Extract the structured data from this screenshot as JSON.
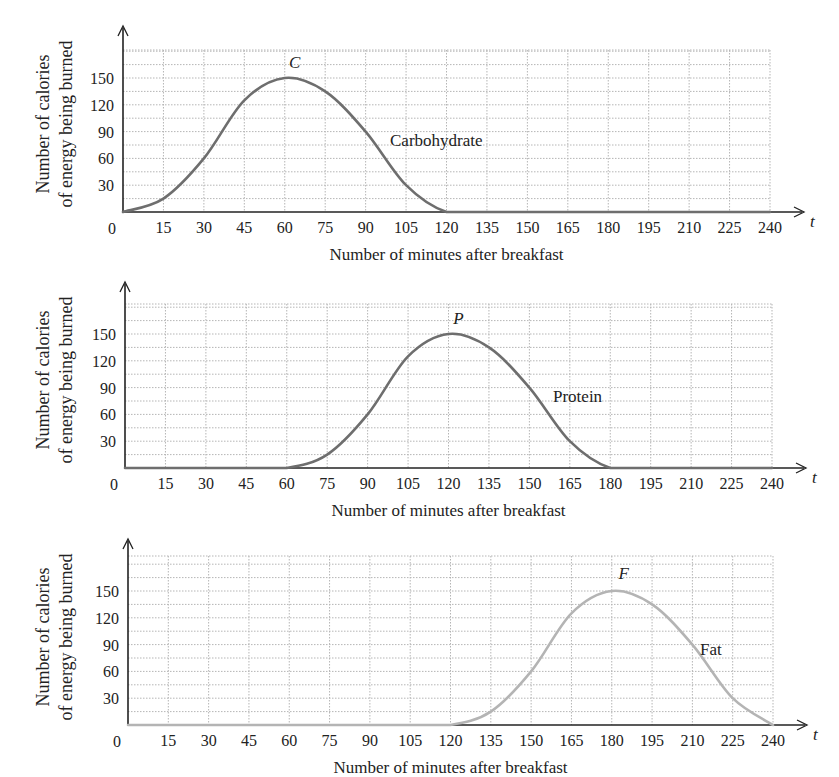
{
  "chart_data": [
    {
      "type": "line",
      "title": "",
      "xlabel": "Number of minutes after breakfast",
      "ylabel": [
        "Number of calories",
        "of energy being burned"
      ],
      "x_axis_var": "t",
      "origin_label": "0",
      "x_ticks": [
        15,
        30,
        45,
        60,
        75,
        90,
        105,
        120,
        135,
        150,
        165,
        180,
        195,
        210,
        225,
        240
      ],
      "y_ticks": [
        30,
        60,
        90,
        120,
        150
      ],
      "xlim": [
        0,
        240
      ],
      "ylim": [
        0,
        180
      ],
      "grid": true,
      "series": [
        {
          "name": "Carbohydrate",
          "peak_label": "C",
          "color": "#6e6e6e",
          "x": [
            0,
            15,
            30,
            45,
            60,
            75,
            90,
            105,
            120,
            135,
            150,
            165,
            180,
            195,
            210,
            225,
            240
          ],
          "values": [
            0,
            15,
            60,
            125,
            150,
            135,
            90,
            30,
            0,
            0,
            0,
            0,
            0,
            0,
            0,
            0,
            0
          ]
        }
      ]
    },
    {
      "type": "line",
      "title": "",
      "xlabel": "Number of minutes after breakfast",
      "ylabel": [
        "Number of calories",
        "of energy being burned"
      ],
      "x_axis_var": "t",
      "origin_label": "0",
      "x_ticks": [
        15,
        30,
        45,
        60,
        75,
        90,
        105,
        120,
        135,
        150,
        165,
        180,
        195,
        210,
        225,
        240
      ],
      "y_ticks": [
        30,
        60,
        90,
        120,
        150
      ],
      "xlim": [
        0,
        240
      ],
      "ylim": [
        0,
        180
      ],
      "grid": true,
      "series": [
        {
          "name": "Protein",
          "peak_label": "P",
          "color": "#6e6e6e",
          "x": [
            0,
            15,
            30,
            45,
            60,
            75,
            90,
            105,
            120,
            135,
            150,
            165,
            180,
            195,
            210,
            225,
            240
          ],
          "values": [
            0,
            0,
            0,
            0,
            0,
            15,
            60,
            125,
            150,
            135,
            90,
            30,
            0,
            0,
            0,
            0,
            0
          ]
        }
      ]
    },
    {
      "type": "line",
      "title": "",
      "xlabel": "Number of minutes after breakfast",
      "ylabel": [
        "Number of calories",
        "of energy being burned"
      ],
      "x_axis_var": "t",
      "origin_label": "0",
      "x_ticks": [
        15,
        30,
        45,
        60,
        75,
        90,
        105,
        120,
        135,
        150,
        165,
        180,
        195,
        210,
        225,
        240
      ],
      "y_ticks": [
        30,
        60,
        90,
        120,
        150
      ],
      "xlim": [
        0,
        240
      ],
      "ylim": [
        0,
        180
      ],
      "grid": true,
      "series": [
        {
          "name": "Fat",
          "peak_label": "F",
          "color": "#b4b4b4",
          "x": [
            0,
            15,
            30,
            45,
            60,
            75,
            90,
            105,
            120,
            135,
            150,
            165,
            180,
            195,
            210,
            225,
            240
          ],
          "values": [
            0,
            0,
            0,
            0,
            0,
            0,
            0,
            0,
            0,
            15,
            60,
            125,
            150,
            135,
            90,
            30,
            0
          ]
        }
      ]
    }
  ],
  "panels": [
    {
      "curve_label": "Carbohydrate",
      "peak_label": "C"
    },
    {
      "curve_label": "Protein",
      "peak_label": "P"
    },
    {
      "curve_label": "Fat",
      "peak_label": "F"
    }
  ]
}
